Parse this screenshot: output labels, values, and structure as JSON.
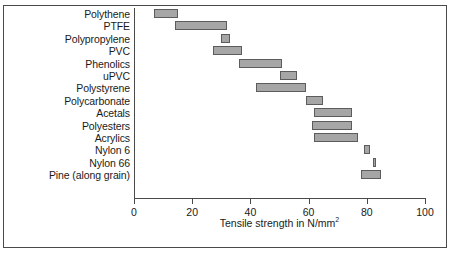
{
  "chart_data": {
    "type": "bar",
    "orientation": "horizontal",
    "subtype": "range-bar",
    "title": "",
    "xlabel": "Tensile strength in N/mm",
    "xlabel_superscript": "2",
    "ylabel": "",
    "xlim": [
      0,
      100
    ],
    "xticks": [
      0,
      20,
      40,
      60,
      80,
      100
    ],
    "xtick_labels": [
      "0",
      "20",
      "40",
      "60",
      "80",
      "100"
    ],
    "grid": false,
    "legend": false,
    "categories": [
      "Polythene",
      "PTFE",
      "Polypropylene",
      "PVC",
      "Phenolics",
      "uPVC",
      "Polystyrene",
      "Polycarbonate",
      "Acetals",
      "Polyesters",
      "Acrylics",
      "Nylon 6",
      "Nylon 66",
      "Pine (along grain)"
    ],
    "ranges": [
      [
        7,
        15
      ],
      [
        14,
        32
      ],
      [
        30,
        33
      ],
      [
        27,
        37
      ],
      [
        36,
        51
      ],
      [
        50,
        56
      ],
      [
        42,
        59
      ],
      [
        59,
        65
      ],
      [
        62,
        75
      ],
      [
        61,
        75
      ],
      [
        62,
        77
      ],
      [
        79,
        81
      ],
      [
        82,
        83
      ],
      [
        78,
        85
      ]
    ],
    "bar_fill_color": "#a6a6a6",
    "bar_border_color": "#5c5c5c",
    "axis_color": "#4a4a4a",
    "text_color": "#1a1a1a"
  }
}
